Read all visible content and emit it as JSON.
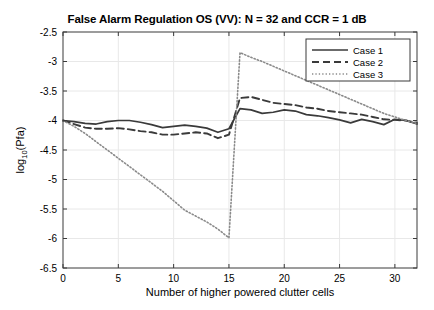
{
  "chart_data": {
    "type": "line",
    "title": "False Alarm Regulation OS (VV): N = 32 and CCR = 1 dB",
    "xlabel": "Number of higher powered clutter cells",
    "ylabel": "log10(Pfa)",
    "ylabel_base": "log",
    "ylabel_sub": "10",
    "ylabel_tail": "(Pfa)",
    "xlim": [
      0,
      32
    ],
    "ylim": [
      -6.5,
      -2.5
    ],
    "xticks": [
      0,
      5,
      10,
      15,
      20,
      25,
      30
    ],
    "xtick_labels": [
      "0",
      "5",
      "10",
      "15",
      "20",
      "25",
      "30"
    ],
    "yticks": [
      -2.5,
      -3,
      -3.5,
      -4,
      -4.5,
      -5,
      -5.5,
      -6,
      -6.5
    ],
    "ytick_labels": [
      "-2.5",
      "-3",
      "-3.5",
      "-4",
      "-4.5",
      "-5",
      "-5.5",
      "-6",
      "-6.5"
    ],
    "grid": true,
    "legend_position": "top-right",
    "x": [
      0,
      1,
      2,
      3,
      4,
      5,
      6,
      7,
      8,
      9,
      10,
      11,
      12,
      13,
      14,
      15,
      16,
      17,
      18,
      19,
      20,
      21,
      22,
      23,
      24,
      25,
      26,
      27,
      28,
      29,
      30,
      31,
      32
    ],
    "series": [
      {
        "name": "Case 1",
        "style": "solid",
        "color": "#3a3a3a",
        "values": [
          -4.0,
          -4.02,
          -4.05,
          -4.06,
          -4.02,
          -4.0,
          -4.0,
          -4.03,
          -4.07,
          -4.12,
          -4.1,
          -4.08,
          -4.1,
          -4.13,
          -4.2,
          -4.14,
          -3.8,
          -3.82,
          -3.88,
          -3.86,
          -3.82,
          -3.84,
          -3.9,
          -3.92,
          -3.95,
          -3.99,
          -4.04,
          -3.98,
          -4.02,
          -4.07,
          -3.98,
          -4.0,
          -4.06
        ]
      },
      {
        "name": "Case 2",
        "style": "dashed",
        "color": "#3a3a3a",
        "values": [
          -4.0,
          -4.06,
          -4.12,
          -4.14,
          -4.14,
          -4.13,
          -4.15,
          -4.18,
          -4.2,
          -4.24,
          -4.24,
          -4.22,
          -4.2,
          -4.22,
          -4.3,
          -4.24,
          -3.62,
          -3.6,
          -3.65,
          -3.7,
          -3.72,
          -3.74,
          -3.78,
          -3.8,
          -3.84,
          -3.86,
          -3.88,
          -3.9,
          -3.94,
          -3.98,
          -3.99,
          -4.0,
          -4.04
        ]
      },
      {
        "name": "Case 3",
        "style": "dotted",
        "color": "#8a8a8a",
        "values": [
          -4.0,
          -4.1,
          -4.22,
          -4.36,
          -4.5,
          -4.64,
          -4.78,
          -4.92,
          -5.06,
          -5.2,
          -5.36,
          -5.52,
          -5.62,
          -5.72,
          -5.84,
          -5.99,
          -2.85,
          -2.93,
          -3.0,
          -3.08,
          -3.16,
          -3.24,
          -3.32,
          -3.4,
          -3.48,
          -3.56,
          -3.64,
          -3.72,
          -3.8,
          -3.88,
          -3.94,
          -4.0,
          -4.05
        ]
      }
    ]
  },
  "legend": {
    "items": [
      {
        "label": "Case 1"
      },
      {
        "label": "Case 2"
      },
      {
        "label": "Case 3"
      }
    ]
  }
}
